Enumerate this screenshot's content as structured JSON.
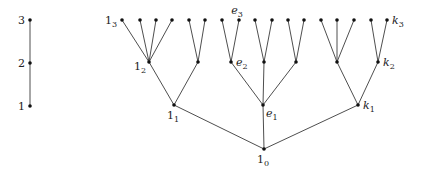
{
  "diagram": {
    "title": "",
    "chain": {
      "nodes": [
        {
          "id": "c3",
          "x": 30,
          "y": 20,
          "label": "3"
        },
        {
          "id": "c2",
          "x": 30,
          "y": 63,
          "label": "2"
        },
        {
          "id": "c1",
          "x": 30,
          "y": 106,
          "label": "1"
        }
      ],
      "edges": [
        [
          "c3",
          "c2"
        ],
        [
          "c2",
          "c1"
        ]
      ]
    },
    "tree": {
      "nodes": [
        {
          "id": "r",
          "x": 264,
          "y": 149,
          "label": "1",
          "sub": "0",
          "italic": false,
          "lpos": "below"
        },
        {
          "id": "a1",
          "x": 174,
          "y": 105,
          "label": "1",
          "sub": "1",
          "italic": false,
          "lpos": "below"
        },
        {
          "id": "b1",
          "x": 263,
          "y": 105,
          "label": "e",
          "sub": "1",
          "italic": true,
          "lpos": "belowright"
        },
        {
          "id": "c1",
          "x": 358,
          "y": 105,
          "label": "k",
          "sub": "1",
          "italic": true,
          "lpos": "right"
        },
        {
          "id": "a2",
          "x": 149,
          "y": 62,
          "label": "1",
          "sub": "2",
          "italic": false,
          "lpos": "belowleft"
        },
        {
          "id": "a2b",
          "x": 198,
          "y": 62
        },
        {
          "id": "b2",
          "x": 231,
          "y": 62,
          "label": "e",
          "sub": "2",
          "italic": true,
          "lpos": "right"
        },
        {
          "id": "b2b",
          "x": 264,
          "y": 62
        },
        {
          "id": "b2c",
          "x": 296,
          "y": 62
        },
        {
          "id": "c2a",
          "x": 337,
          "y": 62
        },
        {
          "id": "c2",
          "x": 378,
          "y": 62,
          "label": "k",
          "sub": "2",
          "italic": true,
          "lpos": "right"
        },
        {
          "id": "l1",
          "x": 122,
          "y": 20,
          "label": "1",
          "sub": "3",
          "italic": false,
          "lpos": "left"
        },
        {
          "id": "l2",
          "x": 140,
          "y": 20
        },
        {
          "id": "l3",
          "x": 156,
          "y": 20
        },
        {
          "id": "l4",
          "x": 172,
          "y": 20
        },
        {
          "id": "l5",
          "x": 189,
          "y": 20
        },
        {
          "id": "l6",
          "x": 205,
          "y": 20
        },
        {
          "id": "l7",
          "x": 222,
          "y": 20
        },
        {
          "id": "l8",
          "x": 239,
          "y": 20,
          "label": "e",
          "sub": "3",
          "italic": true,
          "lpos": "above"
        },
        {
          "id": "l9",
          "x": 255,
          "y": 20
        },
        {
          "id": "l10",
          "x": 272,
          "y": 20
        },
        {
          "id": "l11",
          "x": 288,
          "y": 20
        },
        {
          "id": "l12",
          "x": 304,
          "y": 20
        },
        {
          "id": "l13",
          "x": 321,
          "y": 20
        },
        {
          "id": "l14",
          "x": 337,
          "y": 20
        },
        {
          "id": "l15",
          "x": 354,
          "y": 20
        },
        {
          "id": "l16",
          "x": 371,
          "y": 20
        },
        {
          "id": "l17",
          "x": 387,
          "y": 20,
          "label": "k",
          "sub": "3",
          "italic": true,
          "lpos": "right"
        }
      ],
      "edges": [
        [
          "r",
          "a1"
        ],
        [
          "r",
          "b1"
        ],
        [
          "r",
          "c1"
        ],
        [
          "a1",
          "a2"
        ],
        [
          "a1",
          "a2b"
        ],
        [
          "b1",
          "b2"
        ],
        [
          "b1",
          "b2b"
        ],
        [
          "b1",
          "b2c"
        ],
        [
          "c1",
          "c2a"
        ],
        [
          "c1",
          "c2"
        ],
        [
          "a2",
          "l1"
        ],
        [
          "a2",
          "l2"
        ],
        [
          "a2",
          "l3"
        ],
        [
          "a2",
          "l4"
        ],
        [
          "a2b",
          "l5"
        ],
        [
          "a2b",
          "l6"
        ],
        [
          "b2",
          "l7"
        ],
        [
          "b2",
          "l8"
        ],
        [
          "b2b",
          "l9"
        ],
        [
          "b2b",
          "l10"
        ],
        [
          "b2c",
          "l11"
        ],
        [
          "b2c",
          "l12"
        ],
        [
          "c2a",
          "l13"
        ],
        [
          "c2a",
          "l14"
        ],
        [
          "c2a",
          "l15"
        ],
        [
          "c2",
          "l16"
        ],
        [
          "c2",
          "l17"
        ]
      ]
    },
    "colors": {
      "edge": "#3a3a3a",
      "node": "#111111",
      "label": "#222222",
      "background": "#ffffff"
    }
  }
}
